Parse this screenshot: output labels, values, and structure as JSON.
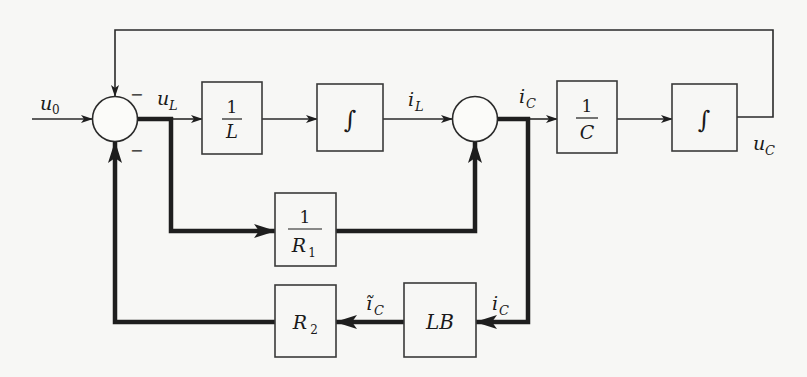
{
  "diagram": {
    "type": "block-diagram",
    "signals": {
      "input": {
        "base": "u",
        "sub": "0"
      },
      "u_L": {
        "base": "u",
        "sub": "L"
      },
      "i_L": {
        "base": "i",
        "sub": "L"
      },
      "i_C_top": {
        "base": "i",
        "sub": "C"
      },
      "u_C": {
        "base": "u",
        "sub": "C"
      },
      "i_C_right": {
        "base": "i",
        "sub": "C"
      },
      "i_C_tilde": {
        "base": "ĩ",
        "sub": "C"
      }
    },
    "summing_junctions": [
      {
        "id": "sum1",
        "signs": {
          "top": "−",
          "bottom": "−"
        }
      },
      {
        "id": "sum2",
        "signs": {}
      }
    ],
    "blocks": {
      "inv_L": {
        "numerator": "1",
        "denominator": "L"
      },
      "integrator1": {
        "symbol": "∫"
      },
      "inv_C": {
        "numerator": "1",
        "denominator": "C"
      },
      "integrator2": {
        "symbol": "∫"
      },
      "inv_R1": {
        "numerator": "1",
        "denominator": "R",
        "denominator_sub": "1"
      },
      "R2": {
        "base": "R",
        "sub": "2"
      },
      "LB": {
        "label": "LB"
      }
    },
    "signs": {
      "minus_top": "−",
      "minus_bottom": "−"
    }
  }
}
